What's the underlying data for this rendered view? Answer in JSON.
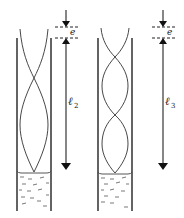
{
  "figure": {
    "tubes": [
      {
        "id": "tube-2",
        "length_label": "ℓ",
        "length_subscript": "2",
        "end_correction_label": "e",
        "loops": 1.5
      },
      {
        "id": "tube-3",
        "length_label": "ℓ",
        "length_subscript": "3",
        "end_correction_label": "e",
        "loops": 2.5
      }
    ],
    "colors": {
      "line": "#222222",
      "background": "#ffffff"
    }
  }
}
